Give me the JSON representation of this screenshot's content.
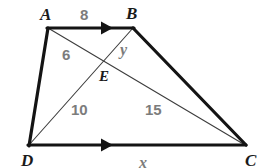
{
  "figure": {
    "kind": "trapezoid-with-diagonals",
    "colors": {
      "outline": "#141414",
      "diagonal": "#3c3c3c",
      "vertex_label": "#1a1a1a",
      "measure_label": "#7c7c7c",
      "background": "#ffffff"
    },
    "vertices": [
      {
        "name": "A",
        "label": "A",
        "x": 48,
        "y": 28,
        "label_x": 40,
        "label_y": 6
      },
      {
        "name": "B",
        "label": "B",
        "x": 133,
        "y": 28,
        "label_x": 126,
        "label_y": 5
      },
      {
        "name": "C",
        "label": "C",
        "x": 245,
        "y": 145,
        "label_x": 245,
        "label_y": 152
      },
      {
        "name": "D",
        "label": "D",
        "x": 29,
        "y": 145,
        "label_x": 21,
        "label_y": 152
      },
      {
        "name": "E",
        "label": "E",
        "x": 100,
        "y": 58,
        "label_x": 99,
        "label_y": 69
      }
    ],
    "edges": [
      {
        "name": "AB",
        "from": "A",
        "to": "B",
        "style": "thick",
        "parallel_mark": true
      },
      {
        "name": "BC",
        "from": "B",
        "to": "C",
        "style": "thick",
        "parallel_mark": false
      },
      {
        "name": "DC",
        "from": "D",
        "to": "C",
        "style": "thick",
        "parallel_mark": true
      },
      {
        "name": "AD",
        "from": "A",
        "to": "D",
        "style": "thick",
        "parallel_mark": false
      }
    ],
    "diagonals": [
      {
        "name": "AC",
        "from": "A",
        "to": "C",
        "style": "thin"
      },
      {
        "name": "BD",
        "from": "B",
        "to": "D",
        "style": "thin"
      }
    ],
    "measures": [
      {
        "name": "AB-length",
        "segment": "AB",
        "text": "8",
        "x": 80,
        "y": 7
      },
      {
        "name": "BE-length",
        "segment": "BE",
        "text": "y",
        "x": 120,
        "y": 42
      },
      {
        "name": "AE-length",
        "segment": "AE",
        "text": "6",
        "x": 62,
        "y": 47
      },
      {
        "name": "DE-length",
        "segment": "DE",
        "text": "10",
        "x": 71,
        "y": 102
      },
      {
        "name": "EC-length",
        "segment": "EC",
        "text": "15",
        "x": 145,
        "y": 102
      },
      {
        "name": "DC-length",
        "segment": "DC",
        "text": "x",
        "x": 139,
        "y": 155
      }
    ]
  }
}
